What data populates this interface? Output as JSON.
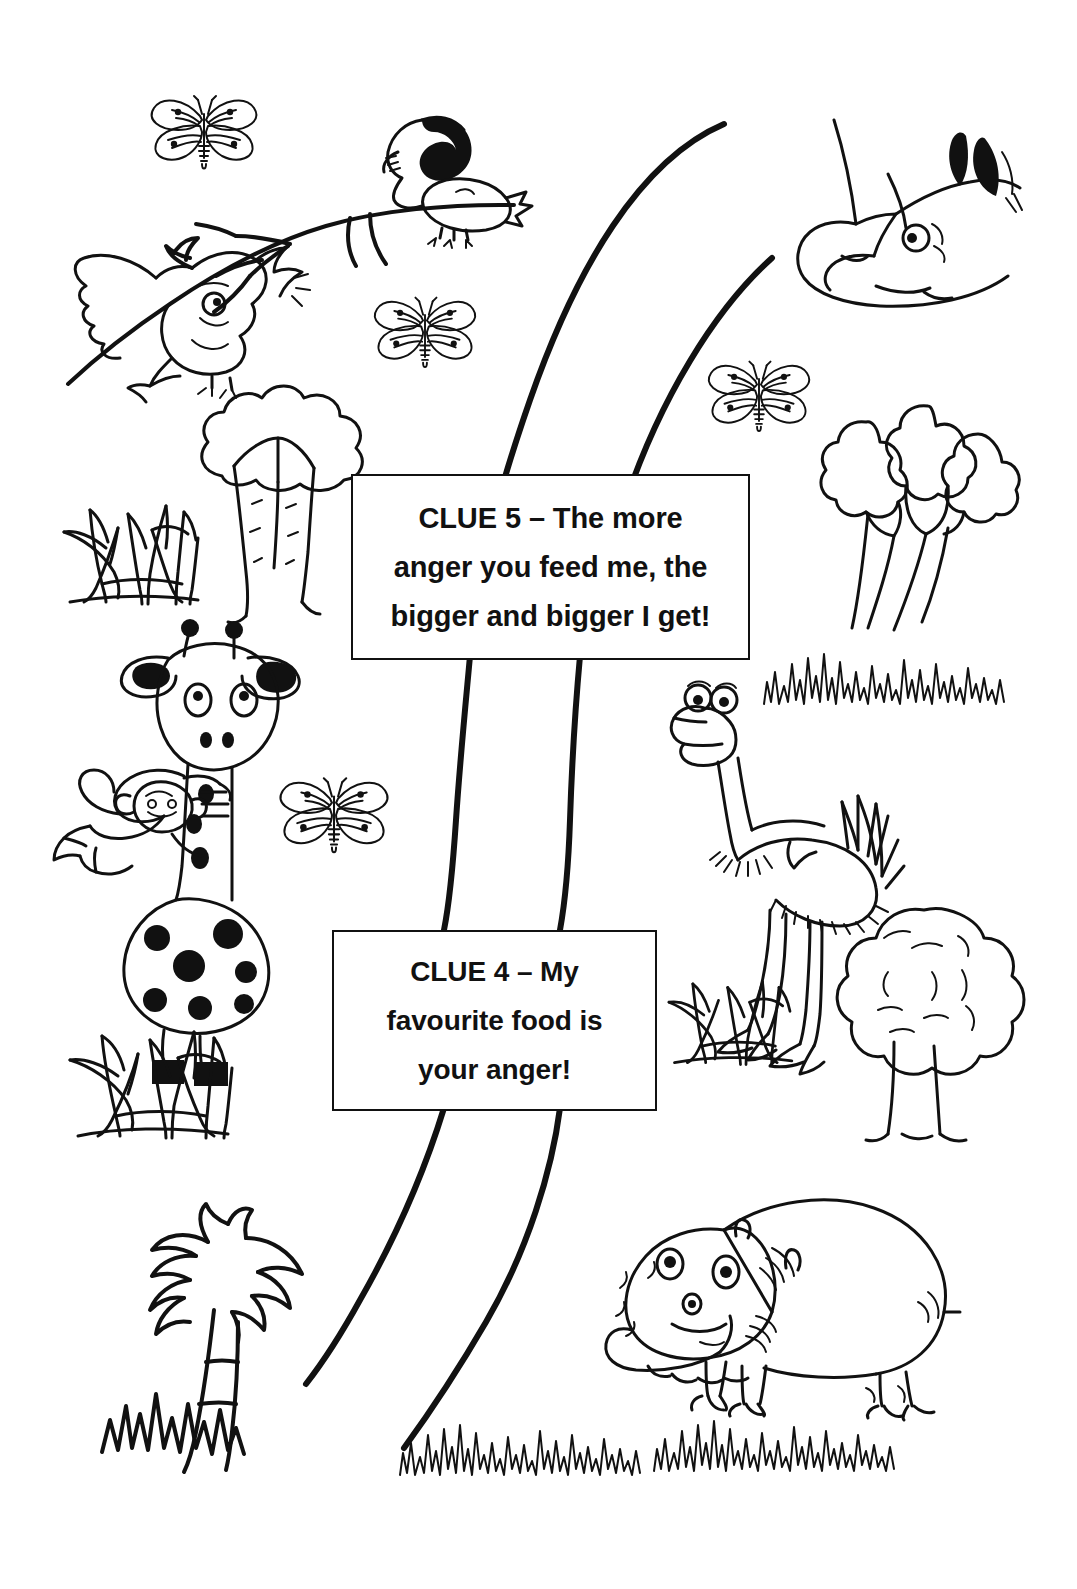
{
  "page": {
    "background_color": "#ffffff",
    "ink_color": "#111111"
  },
  "clues": [
    {
      "id": "clue-5",
      "lines": [
        "CLUE 5 – The more",
        "anger you feed me, the",
        "bigger and bigger I get!"
      ]
    },
    {
      "id": "clue-4",
      "lines": [
        "CLUE 4 – My",
        "favourite food is",
        "your anger!"
      ]
    }
  ],
  "scene": {
    "path_label": "winding-trail",
    "animals": [
      {
        "name": "flying-bird",
        "label": "Bird with open beak flying"
      },
      {
        "name": "perched-bird",
        "label": "Bird with black crest perched on branch"
      },
      {
        "name": "rhino",
        "label": "Rhinoceros head with two horns"
      },
      {
        "name": "giraffe",
        "label": "Spotted giraffe"
      },
      {
        "name": "monkey",
        "label": "Monkey hanging on giraffe neck"
      },
      {
        "name": "ostrich",
        "label": "Ostrich standing"
      },
      {
        "name": "hippo",
        "label": "Hippopotamus standing"
      }
    ],
    "butterflies": [
      {
        "name": "butterfly-top-left"
      },
      {
        "name": "butterfly-upper-mid"
      },
      {
        "name": "butterfly-upper-right"
      },
      {
        "name": "butterfly-mid-left"
      }
    ],
    "trees": [
      {
        "name": "tree-upper-left",
        "label": "Broccoli shaped tree"
      },
      {
        "name": "tree-upper-right",
        "label": "Three-cloud canopy tree"
      },
      {
        "name": "tree-lower-right",
        "label": "Round bushy tree"
      },
      {
        "name": "palm-tree",
        "label": "Palm tree with ringed trunk"
      }
    ],
    "grass": [
      {
        "name": "grass-clump-left-upper"
      },
      {
        "name": "grass-clump-left-lower"
      },
      {
        "name": "grass-clump-right-mid"
      },
      {
        "name": "grass-tuft-right-upper"
      },
      {
        "name": "grass-tuft-bottom-left"
      },
      {
        "name": "grass-tuft-bottom-right"
      },
      {
        "name": "grass-under-palm"
      }
    ]
  }
}
